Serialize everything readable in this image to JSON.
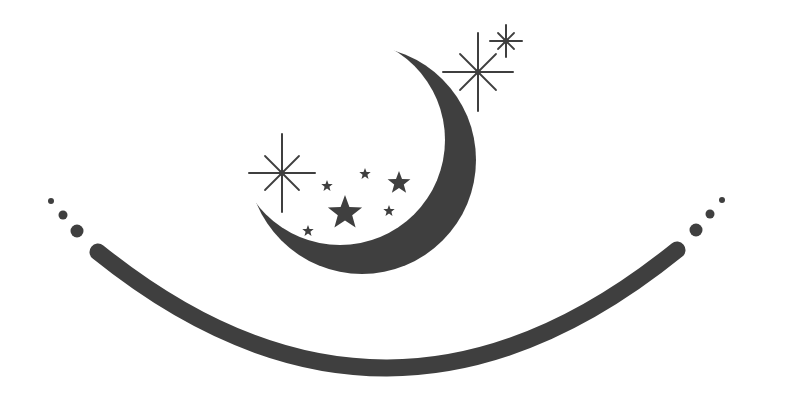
{
  "logo": {
    "description": "Crescent moon with stars above a smiling arc",
    "colors": {
      "ink": "#3f3f3f",
      "background": "#ffffff"
    },
    "moon": {
      "outer": {
        "cx": 362,
        "cy": 160,
        "r": 114
      },
      "inner": {
        "cx": 340,
        "cy": 140,
        "r": 105
      }
    },
    "arc": {
      "start": [
        98,
        252
      ],
      "control": [
        387,
        485
      ],
      "end": [
        677,
        250
      ],
      "width": 17
    },
    "dots_left": [
      {
        "cx": 51,
        "cy": 201,
        "r": 3
      },
      {
        "cx": 63,
        "cy": 215,
        "r": 4.5
      },
      {
        "cx": 77,
        "cy": 231,
        "r": 6.5
      }
    ],
    "dots_right": [
      {
        "cx": 722,
        "cy": 200,
        "r": 3
      },
      {
        "cx": 710,
        "cy": 214,
        "r": 4.5
      },
      {
        "cx": 696,
        "cy": 230,
        "r": 6.5
      }
    ],
    "stars": [
      {
        "cx": 327,
        "cy": 186,
        "r": 6
      },
      {
        "cx": 365,
        "cy": 174,
        "r": 6
      },
      {
        "cx": 399,
        "cy": 183,
        "r": 12
      },
      {
        "cx": 345,
        "cy": 213,
        "r": 18
      },
      {
        "cx": 389,
        "cy": 211,
        "r": 6
      },
      {
        "cx": 308,
        "cy": 231,
        "r": 6
      }
    ],
    "sparkles": [
      {
        "cx": 478,
        "cy": 72,
        "v": 39,
        "h": 35,
        "d": 18
      },
      {
        "cx": 506,
        "cy": 41,
        "v": 16,
        "h": 16,
        "d": 8
      },
      {
        "cx": 282,
        "cy": 173,
        "v": 39,
        "h": 33,
        "d": 17
      }
    ]
  }
}
